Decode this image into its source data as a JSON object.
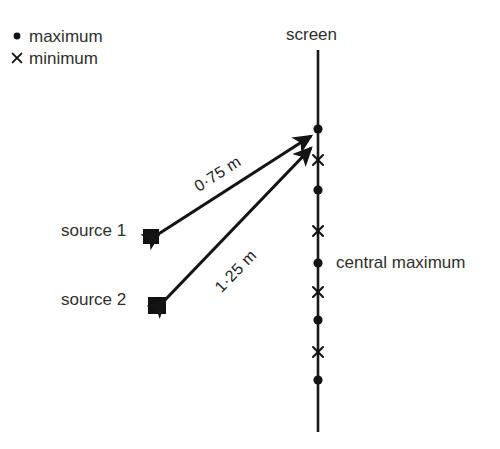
{
  "diagram": {
    "background_color": "#ffffff",
    "ink_color": "#1a1a1a",
    "text_color": "#2f2f2f"
  },
  "legend": {
    "items": [
      {
        "marker": "maximum-dot-icon",
        "glyph": "dot",
        "label": "maximum"
      },
      {
        "marker": "minimum-cross-icon",
        "glyph": "cross",
        "label": "minimum"
      }
    ]
  },
  "screen": {
    "label": "screen",
    "line": {
      "x": 318,
      "y_top": 50,
      "y_bottom": 432
    },
    "markers": [
      {
        "type": "maximum",
        "glyph": "dot",
        "y": 129
      },
      {
        "type": "minimum",
        "glyph": "cross",
        "y": 160
      },
      {
        "type": "maximum",
        "glyph": "dot",
        "y": 190
      },
      {
        "type": "minimum",
        "glyph": "cross",
        "y": 231
      },
      {
        "type": "maximum",
        "glyph": "dot",
        "y": 263
      },
      {
        "type": "minimum",
        "glyph": "cross",
        "y": 292
      },
      {
        "type": "maximum",
        "glyph": "dot",
        "y": 320
      },
      {
        "type": "minimum",
        "glyph": "cross",
        "y": 352
      },
      {
        "type": "maximum",
        "glyph": "dot",
        "y": 380
      }
    ],
    "central_maximum_label": "central maximum",
    "central_maximum_y": 263
  },
  "sources": [
    {
      "id": "source-1",
      "label": "source 1",
      "x": 150,
      "y": 236
    },
    {
      "id": "source-2",
      "label": "source 2",
      "x": 156,
      "y": 305
    }
  ],
  "paths": [
    {
      "id": "path-1",
      "from": "source 1",
      "to": "maximum",
      "distance_label": "0·75 m",
      "value": 0.75,
      "unit": "m",
      "arrow": "double"
    },
    {
      "id": "path-2",
      "from": "source 2",
      "to": "maximum",
      "distance_label": "1·25 m",
      "value": 1.25,
      "unit": "m",
      "arrow": "double"
    }
  ]
}
